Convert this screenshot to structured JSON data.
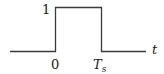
{
  "diagram": {
    "type": "rectangular-pulse",
    "line_color": "#3a3a3a",
    "amplitude_label": "1",
    "start_label": "0",
    "end_label_main": "T",
    "end_label_sub": "s",
    "axis_label": "t"
  }
}
